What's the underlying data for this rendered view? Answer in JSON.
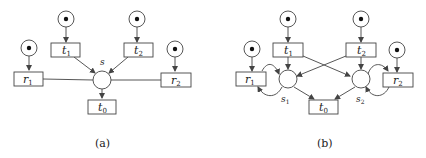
{
  "figure": {
    "panel_a": {
      "caption": "(a)",
      "place_s_label": "s",
      "transitions": {
        "t1": {
          "name": "t",
          "sub": "1"
        },
        "t2": {
          "name": "t",
          "sub": "2"
        },
        "t0": {
          "name": "t",
          "sub": "0"
        },
        "r1": {
          "name": "r",
          "sub": "1"
        },
        "r2": {
          "name": "r",
          "sub": "2"
        }
      },
      "marked_places": 4
    },
    "panel_b": {
      "caption": "(b)",
      "place_s1_label": {
        "name": "s",
        "sub": "1"
      },
      "place_s2_label": {
        "name": "s",
        "sub": "2"
      },
      "transitions": {
        "t1": {
          "name": "t",
          "sub": "1"
        },
        "t2": {
          "name": "t",
          "sub": "2"
        },
        "t0": {
          "name": "t",
          "sub": "0"
        },
        "r1": {
          "name": "r",
          "sub": "1"
        },
        "r2": {
          "name": "r",
          "sub": "2"
        }
      },
      "marked_places": 4
    },
    "colors": {
      "stroke": "#333333",
      "token": "#111111",
      "background": "#ffffff"
    }
  }
}
